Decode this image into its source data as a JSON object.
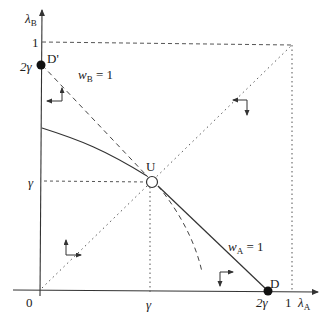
{
  "diagram": {
    "axes": {
      "y_label": "λ",
      "y_label_sub": "B",
      "x_label": "λ",
      "x_label_sub": "A",
      "origin_label": "0"
    },
    "ticks": {
      "y_one": "1",
      "y_two_gamma": "2γ",
      "y_gamma": "γ",
      "x_gamma": "γ",
      "x_two_gamma": "2γ",
      "x_one": "1"
    },
    "points": {
      "d_prime": "D'",
      "d": "D",
      "u": "U"
    },
    "curve_labels": {
      "wb_label": "w",
      "wb_sub": "B",
      "wb_eq": " = 1",
      "wa_label": "w",
      "wa_sub": "A",
      "wa_eq": " = 1"
    },
    "colors": {
      "line": "#333333",
      "dotted": "#555555",
      "background": "#ffffff"
    }
  }
}
